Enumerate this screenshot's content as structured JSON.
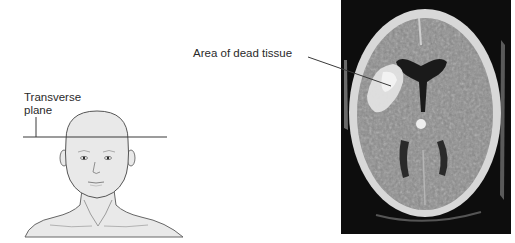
{
  "figure": {
    "head_illustration": {
      "plane_label": "Transverse plane",
      "plane_label_lines": [
        "Transverse",
        "plane"
      ]
    },
    "ct_scan": {
      "callout_label": "Area of dead tissue"
    },
    "colors": {
      "skin_fill": "#e9e9e9",
      "outline": "#555555",
      "plane_line": "#3a3a3a",
      "ct_background": "#0d0d0d",
      "skull": "#d8d8d8",
      "brain": "#8a8a8a",
      "lesion": "#e2e2e2",
      "ventricle": "#1a1a1a"
    }
  }
}
